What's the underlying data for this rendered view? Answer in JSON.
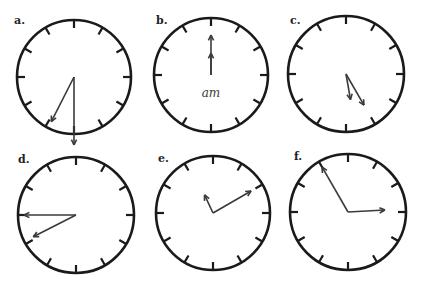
{
  "figure": {
    "clocks": [
      {
        "label": "a.",
        "cx": 74,
        "cy": 77,
        "r": 57,
        "label_x": 14,
        "label_y": 14,
        "hands": [
          {
            "angle": 180,
            "len": 68,
            "kind": "long"
          },
          {
            "angle": 207,
            "len": 50,
            "kind": "short"
          }
        ],
        "annotation": ""
      },
      {
        "label": "b.",
        "cx": 211,
        "cy": 75,
        "r": 57,
        "label_x": 156,
        "label_y": 14,
        "hands": [
          {
            "angle": 0,
            "len": 40,
            "kind": "long"
          },
          {
            "angle": 0,
            "len": 22,
            "kind": "short"
          }
        ],
        "annotation": "am"
      },
      {
        "label": "c.",
        "cx": 346,
        "cy": 74,
        "r": 58,
        "label_x": 290,
        "label_y": 14,
        "hands": [
          {
            "angle": 150,
            "len": 36,
            "kind": "long"
          },
          {
            "angle": 170,
            "len": 26,
            "kind": "short"
          }
        ],
        "annotation": ""
      },
      {
        "label": "d.",
        "cx": 76,
        "cy": 215,
        "r": 58,
        "label_x": 18,
        "label_y": 153,
        "hands": [
          {
            "angle": 270,
            "len": 52,
            "kind": "long"
          },
          {
            "angle": 243,
            "len": 48,
            "kind": "short"
          }
        ],
        "annotation": ""
      },
      {
        "label": "e.",
        "cx": 213,
        "cy": 213,
        "r": 57,
        "label_x": 158,
        "label_y": 152,
        "hands": [
          {
            "angle": 60,
            "len": 44,
            "kind": "long"
          },
          {
            "angle": 335,
            "len": 20,
            "kind": "short"
          }
        ],
        "annotation": ""
      },
      {
        "label": "f.",
        "cx": 348,
        "cy": 212,
        "r": 58,
        "label_x": 294,
        "label_y": 150,
        "hands": [
          {
            "angle": 330,
            "len": 52,
            "kind": "short"
          },
          {
            "angle": 87,
            "len": 37,
            "kind": "long"
          }
        ],
        "annotation": ""
      }
    ],
    "colors": {
      "stroke": "#1a1a1a",
      "hand": "#3a3a3a",
      "background": "#ffffff"
    }
  }
}
